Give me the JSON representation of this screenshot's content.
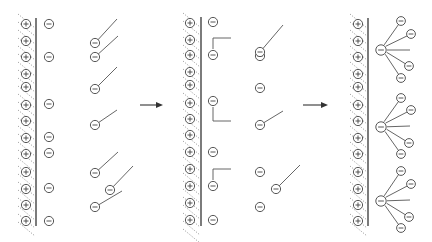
{
  "diagram": {
    "title": "",
    "colors": {
      "line": "#444444",
      "hatch": "#888888",
      "background": "#ffffff"
    },
    "symbols": {
      "positive": "⊕",
      "negative": "⊖"
    },
    "arrows": [
      {
        "id": "arrow-1",
        "from_panel": 1,
        "to_panel": 2,
        "x1": 140,
        "y1": 105,
        "x2": 163,
        "y2": 105
      },
      {
        "id": "arrow-2",
        "from_panel": 2,
        "to_panel": 3,
        "x1": 303,
        "y1": 105,
        "x2": 328,
        "y2": 105
      }
    ],
    "panels": [
      {
        "id": "panel-1",
        "stage": "initial",
        "wall_x": 36,
        "wall_y": [
          18,
          226
        ],
        "surface_charges_x": 26,
        "surface_charges_y": [
          24,
          41,
          57,
          74,
          87,
          105,
          121,
          138,
          154,
          172,
          189,
          205,
          221
        ],
        "free_counterions": [
          [
            49,
            24
          ],
          [
            49,
            57
          ],
          [
            49,
            104
          ],
          [
            49,
            137
          ],
          [
            49,
            153
          ],
          [
            49,
            188
          ],
          [
            49,
            221
          ]
        ],
        "surfactants": [
          {
            "head": [
              95,
              43
            ],
            "tail": [
              [
                95,
                43
              ],
              [
                117,
                19
              ]
            ]
          },
          {
            "head": [
              95,
              57
            ],
            "tail": [
              [
                95,
                57
              ],
              [
                118,
                36
              ]
            ]
          },
          {
            "head": [
              95,
              89
            ],
            "tail": [
              [
                95,
                89
              ],
              [
                117,
                67
              ]
            ]
          },
          {
            "head": [
              95,
              125
            ],
            "tail": [
              [
                95,
                125
              ],
              [
                117,
                110
              ]
            ]
          },
          {
            "head": [
              95,
              173
            ],
            "tail": [
              [
                95,
                173
              ],
              [
                118,
                152
              ]
            ]
          },
          {
            "head": [
              110,
              190
            ],
            "tail": [
              [
                110,
                190
              ],
              [
                133,
                166
              ]
            ]
          },
          {
            "head": [
              95,
              207
            ],
            "tail": [
              [
                95,
                207
              ],
              [
                122,
                191
              ]
            ]
          }
        ]
      },
      {
        "id": "panel-2",
        "stage": "monomer adsorption",
        "wall_x": 201,
        "wall_y": [
          17,
          226
        ],
        "surface_charges_x": 190,
        "surface_charges_y": [
          23,
          40,
          55,
          72,
          85,
          103,
          119,
          135,
          152,
          169,
          186,
          203,
          220
        ],
        "free_counterions": [
          [
            213,
            22
          ],
          [
            213,
            152
          ],
          [
            213,
            220
          ]
        ],
        "adsorbed_surfactants": [
          {
            "head": [
              213,
              55
            ],
            "tail": [
              [
                213,
                49
              ],
              [
                213,
                38
              ],
              [
                231,
                38
              ]
            ]
          },
          {
            "head": [
              213,
              101
            ],
            "tail": [
              [
                213,
                107
              ],
              [
                213,
                121
              ],
              [
                231,
                121
              ]
            ]
          },
          {
            "head": [
              213,
              186
            ],
            "tail": [
              [
                213,
                180
              ],
              [
                213,
                169
              ],
              [
                231,
                169
              ]
            ]
          }
        ],
        "bulk_ions": [
          [
            260,
            56
          ],
          [
            260,
            88
          ],
          [
            260,
            172
          ],
          [
            260,
            207
          ]
        ],
        "surfactants": [
          {
            "head": [
              260,
              52
            ],
            "tail": [
              [
                260,
                52
              ],
              [
                283,
                25
              ]
            ]
          },
          {
            "head": [
              260,
              125
            ],
            "tail": [
              [
                260,
                125
              ],
              [
                283,
                111
              ]
            ]
          },
          {
            "head": [
              276,
              189
            ],
            "tail": [
              [
                276,
                189
              ],
              [
                300,
                165
              ]
            ]
          }
        ]
      },
      {
        "id": "panel-3",
        "stage": "hemimicelle / aggregate formation",
        "wall_x": 368,
        "wall_y": [
          18,
          226
        ],
        "surface_charges_x": 358,
        "surface_charges_y": [
          24,
          41,
          57,
          74,
          87,
          105,
          121,
          138,
          154,
          172,
          189,
          205,
          221
        ],
        "aggregates": [
          {
            "center": [
              381,
              50
            ],
            "spokes": [
              {
                "end": [
                  389,
                  37
                ],
                "ion": [
                  401,
                  21
                ]
              },
              {
                "end": [
                  395,
                  39
                ],
                "ion": [
                  411,
                  34
                ]
              },
              {
                "end": [
                  410,
                  50
                ],
                "ion": null
              },
              {
                "end": [
                  396,
                  56
                ],
                "ion": [
                  409,
                  66
                ]
              },
              {
                "end": [
                  390,
                  59
                ],
                "ion": [
                  401,
                  78
                ]
              }
            ]
          },
          {
            "center": [
              381,
              127
            ],
            "spokes": [
              {
                "end": [
                  389,
                  113
                ],
                "ion": [
                  401,
                  98
                ]
              },
              {
                "end": [
                  395,
                  115
                ],
                "ion": [
                  411,
                  110
                ]
              },
              {
                "end": [
                  410,
                  126
                ],
                "ion": null
              },
              {
                "end": [
                  396,
                  133
                ],
                "ion": [
                  409,
                  143
                ]
              },
              {
                "end": [
                  390,
                  137
                ],
                "ion": [
                  401,
                  154
                ]
              }
            ]
          },
          {
            "center": [
              381,
              201
            ],
            "spokes": [
              {
                "end": [
                  389,
                  188
                ],
                "ion": [
                  401,
                  171
                ]
              },
              {
                "end": [
                  395,
                  190
                ],
                "ion": [
                  411,
                  184
                ]
              },
              {
                "end": [
                  410,
                  200
                ],
                "ion": null
              },
              {
                "end": [
                  396,
                  207
                ],
                "ion": [
                  409,
                  217
                ]
              },
              {
                "end": [
                  390,
                  211
                ],
                "ion": [
                  401,
                  228
                ]
              }
            ]
          }
        ]
      }
    ]
  }
}
